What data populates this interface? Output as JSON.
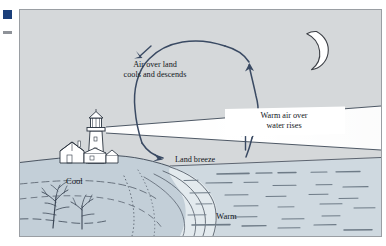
{
  "figure": {
    "type": "land-breeze-diagram",
    "background_color": "#d5d8da",
    "border_color": "#9a9ea3",
    "land_color": "#c3cfd8",
    "water_color": "#cfd9e0",
    "arrow_color": "#3a4a63",
    "ink_color": "#2b3440",
    "beam_color": "#ffffff",
    "margin_marks": {
      "square_color": "#1b3f7a",
      "dash_color": "#8e9298"
    },
    "labels": {
      "air_over_land": "Air over land\ncools and descends",
      "warm_air_over_water": "Warm air over\nwater rises",
      "land_breeze": "Land breeze",
      "cool": "Cool",
      "warm": "Warm"
    },
    "scene_elements": [
      "moon",
      "lighthouse",
      "lighthouse-beam",
      "cottage",
      "shrubs",
      "shoreline",
      "ocean-waves",
      "circulation-loop-arrow"
    ]
  }
}
